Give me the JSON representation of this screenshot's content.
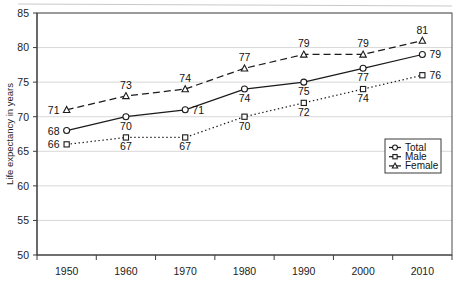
{
  "chart_data": {
    "type": "line",
    "title": "",
    "xlabel": "",
    "ylabel": "Life expectancy in years",
    "categories": [
      "1950",
      "1960",
      "1970",
      "1980",
      "1990",
      "2000",
      "2010"
    ],
    "ylim": [
      50,
      85
    ],
    "yticks": [
      "50",
      "55",
      "60",
      "65",
      "70",
      "75",
      "80",
      "85"
    ],
    "grid": true,
    "legend_position": "bottom-right",
    "series": [
      {
        "name": "Total",
        "marker": "circle",
        "linestyle": "solid",
        "color": "#1b1b1b",
        "values": [
          68,
          70,
          71,
          74,
          75,
          77,
          79
        ]
      },
      {
        "name": "Male",
        "marker": "square",
        "linestyle": "dotted",
        "color": "#1b1b1b",
        "values": [
          66,
          67,
          67,
          70,
          72,
          74,
          76
        ]
      },
      {
        "name": "Female",
        "marker": "triangle",
        "linestyle": "dashed",
        "color": "#1b1b1b",
        "values": [
          71,
          73,
          74,
          77,
          79,
          79,
          81
        ]
      }
    ]
  },
  "legend": {
    "items": [
      {
        "label": "Total",
        "marker": "circle"
      },
      {
        "label": "Male",
        "marker": "square"
      },
      {
        "label": "Female",
        "marker": "triangle"
      }
    ]
  }
}
